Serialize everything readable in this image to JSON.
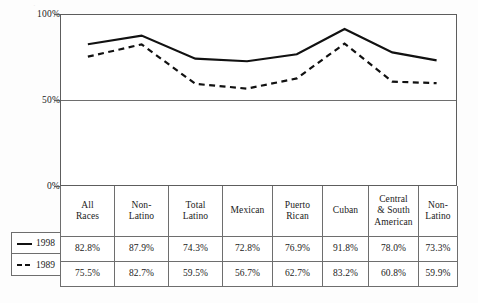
{
  "chart_data": {
    "type": "line",
    "title": "",
    "subtitle": "",
    "xlabel": "",
    "ylabel": "",
    "ylim": [
      0,
      100
    ],
    "yticks": [
      "0%",
      "50%",
      "100%"
    ],
    "ytick_values": [
      0,
      50,
      100
    ],
    "grid": "horizontal-50-only",
    "legend_position": "table-left",
    "categories": [
      "All Races",
      "Non-Latino",
      "Total Latino",
      "Mexican",
      "Puerto Rican",
      "Cuban",
      "Central & South American",
      "Non-Latino"
    ],
    "category_lines": [
      [
        "All",
        "Races"
      ],
      [
        "Non-",
        "Latino"
      ],
      [
        "Total",
        "Latino"
      ],
      [
        "Mexican"
      ],
      [
        "Puerto",
        "Rican"
      ],
      [
        "Cuban"
      ],
      [
        "Central",
        "& South",
        "American"
      ],
      [
        "Non-",
        "Latino"
      ]
    ],
    "series": [
      {
        "name": "1998",
        "style": "solid",
        "color": "#111111",
        "values": [
          82.8,
          87.9,
          74.3,
          72.8,
          76.9,
          91.8,
          78.0,
          73.3
        ],
        "labels": [
          "82.8%",
          "87.9%",
          "74.3%",
          "72.8%",
          "76.9%",
          "91.8%",
          "78.0%",
          "73.3%"
        ]
      },
      {
        "name": "1989",
        "style": "dashed",
        "color": "#111111",
        "values": [
          75.5,
          82.7,
          59.5,
          56.7,
          62.7,
          83.2,
          60.8,
          59.9
        ],
        "labels": [
          "75.5%",
          "82.7%",
          "59.5%",
          "56.7%",
          "62.7%",
          "83.2%",
          "60.8%",
          "59.9%"
        ]
      }
    ]
  },
  "axis": {
    "y": {
      "ticks": [
        {
          "label": "100%",
          "value": 100
        },
        {
          "label": "50%",
          "value": 50
        },
        {
          "label": "0%",
          "value": 0
        }
      ]
    }
  },
  "table": {
    "header": [
      "All Races",
      "Non-Latino",
      "Total Latino",
      "Mexican",
      "Puerto Rican",
      "Cuban",
      "Central & South American",
      "Non-Latino"
    ],
    "rows": [
      {
        "legend_label": "1998",
        "legend_style": "solid",
        "cells": [
          "82.8%",
          "87.9%",
          "74.3%",
          "72.8%",
          "76.9%",
          "91.8%",
          "78.0%",
          "73.3%"
        ]
      },
      {
        "legend_label": "1989",
        "legend_style": "dashed",
        "cells": [
          "75.5%",
          "82.7%",
          "59.5%",
          "56.7%",
          "62.7%",
          "83.2%",
          "60.8%",
          "59.9%"
        ]
      }
    ]
  },
  "colors": {
    "line": "#111111",
    "border": "#6e6e6e",
    "text": "#1a1a1a",
    "background": "#fdfdfd",
    "plot_background": "#ffffff"
  }
}
